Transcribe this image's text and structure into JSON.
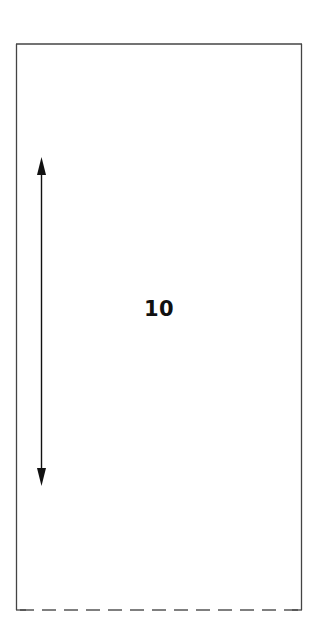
{
  "diagram": {
    "width": 332,
    "height": 643,
    "background": "#ffffff",
    "stroke_color": "#444444",
    "arrow_color": "#111111",
    "rectangle": {
      "x": 16,
      "y": 44,
      "width": 286,
      "height": 566,
      "top_edge": "solid",
      "left_edge": "solid",
      "right_edge": "solid",
      "bottom_edge": "dashed"
    },
    "dimension_arrow": {
      "orientation": "vertical",
      "double_headed": true,
      "x": 41,
      "y_start": 157,
      "y_end": 486
    },
    "label": {
      "text": "10",
      "x": 159,
      "y": 309
    }
  }
}
